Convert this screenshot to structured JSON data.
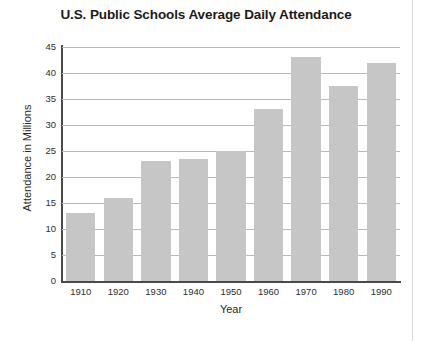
{
  "chart_data": {
    "type": "bar",
    "title": "U.S. Public Schools Average Daily Attendance",
    "xlabel": "Year",
    "ylabel": "Attendance in Millions",
    "categories": [
      "1910",
      "1920",
      "1930",
      "1940",
      "1950",
      "1960",
      "1970",
      "1980",
      "1990"
    ],
    "values": [
      13,
      16,
      23,
      23.5,
      25,
      33,
      43,
      37.5,
      42
    ],
    "ylim": [
      0,
      45
    ],
    "ytick_values": [
      0,
      5,
      10,
      15,
      20,
      25,
      30,
      35,
      40,
      45
    ],
    "ytick_labels": [
      "0",
      "5",
      "10",
      "15",
      "20",
      "25",
      "30",
      "35",
      "40",
      "45"
    ],
    "grid": true,
    "legend": "none",
    "bar_color": "#c6c6c6",
    "axis_color": "#4a4a4a",
    "grid_color": "#b9b9b9"
  }
}
